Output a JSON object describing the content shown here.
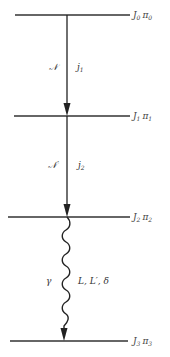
{
  "diagram": {
    "type": "nuclear-decay-cascade",
    "levels": [
      {
        "id": "L0",
        "label": "J",
        "sub": "0",
        "parity": "π",
        "parity_sub": "0",
        "y": 15,
        "x1": 15,
        "x2": 130
      },
      {
        "id": "L1",
        "label": "J",
        "sub": "1",
        "parity": "π",
        "parity_sub": "1",
        "y": 116,
        "x1": 14,
        "x2": 130
      },
      {
        "id": "L2",
        "label": "J",
        "sub": "2",
        "parity": "π",
        "parity_sub": "2",
        "y": 217,
        "x1": 8,
        "x2": 130
      },
      {
        "id": "L3",
        "label": "J",
        "sub": "3",
        "parity": "π",
        "parity_sub": "3",
        "y": 341,
        "x1": 10,
        "x2": 128
      }
    ],
    "transitions": [
      {
        "from": "L0",
        "to": "L1",
        "style": "straight",
        "left_label": "𝒩",
        "right_label": "j",
        "right_sub": "1"
      },
      {
        "from": "L1",
        "to": "L2",
        "style": "straight",
        "left_label": "𝒩′",
        "right_label": "j",
        "right_sub": "2"
      },
      {
        "from": "L2",
        "to": "L3",
        "style": "wavy",
        "left_label": "γ",
        "right_label": "L, L′, δ"
      }
    ],
    "line_color": "#222222"
  }
}
